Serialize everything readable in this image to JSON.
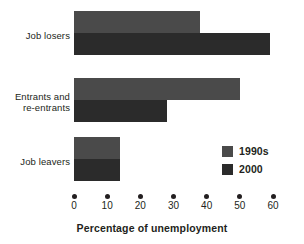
{
  "chart_data": {
    "type": "bar",
    "orientation": "horizontal",
    "title": "",
    "xlabel": "Percentage of unemployment",
    "ylabel": "",
    "categories": [
      "Job losers",
      "Entrants and re-entrants",
      "Job leavers"
    ],
    "series": [
      {
        "name": "1990s",
        "color": "#4a4a4a",
        "values": [
          38,
          50,
          14
        ]
      },
      {
        "name": "2000",
        "color": "#2b2b2b",
        "values": [
          59,
          28,
          14
        ]
      }
    ],
    "xlim": [
      0,
      60
    ],
    "xticks": [
      0,
      10,
      20,
      30,
      40,
      50,
      60
    ],
    "xtick_labels": [
      "0",
      "10",
      "20",
      "30",
      "40",
      "50",
      "60"
    ],
    "grid": false,
    "legend_position": "inside-bottom-right",
    "tick_marker": "dot"
  },
  "axis": {
    "title": "Percentage of unemployment"
  },
  "legend": {
    "entries": [
      {
        "label": "1990s"
      },
      {
        "label": "2000"
      }
    ]
  },
  "groups": [
    {
      "label": "Job losers",
      "label_line_1": "Job losers",
      "label_line_2": ""
    },
    {
      "label": "Entrants and re-entrants",
      "label_line_1": "Entrants and",
      "label_line_2": "re-entrants"
    },
    {
      "label": "Job leavers",
      "label_line_1": "Job leavers",
      "label_line_2": ""
    }
  ],
  "ticks": [
    {
      "value": 0,
      "label": "0"
    },
    {
      "value": 10,
      "label": "10"
    },
    {
      "value": 20,
      "label": "20"
    },
    {
      "value": 30,
      "label": "30"
    },
    {
      "value": 40,
      "label": "40"
    },
    {
      "value": 50,
      "label": "50"
    },
    {
      "value": 60,
      "label": "60"
    }
  ]
}
